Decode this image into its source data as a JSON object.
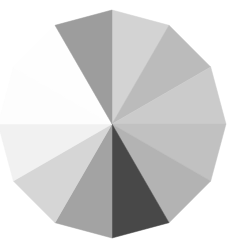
{
  "chart_data": {
    "type": "pie",
    "title": "",
    "shape": "12-sided polygon pie",
    "center": [
      112,
      124
    ],
    "radius": 114,
    "start_angle_deg_clockwise_from_top": 0,
    "categories": [
      "S1",
      "S2",
      "S3",
      "S4",
      "S5",
      "S6",
      "S7",
      "S8",
      "S9",
      "S10",
      "S11",
      "S12"
    ],
    "values": [
      1,
      1,
      1,
      1,
      1,
      1,
      1,
      1,
      1,
      1,
      1,
      1
    ],
    "colors": [
      "#d3d3d3",
      "#bbbbbb",
      "#cbcbcb",
      "#c1c1c1",
      "#b3b3b3",
      "#484848",
      "#a3a3a3",
      "#d6d6d6",
      "#f1f1f1",
      "#fdfdfd",
      "#fefefe",
      "#9d9d9d"
    ],
    "legend": null,
    "labels_visible": false
  }
}
